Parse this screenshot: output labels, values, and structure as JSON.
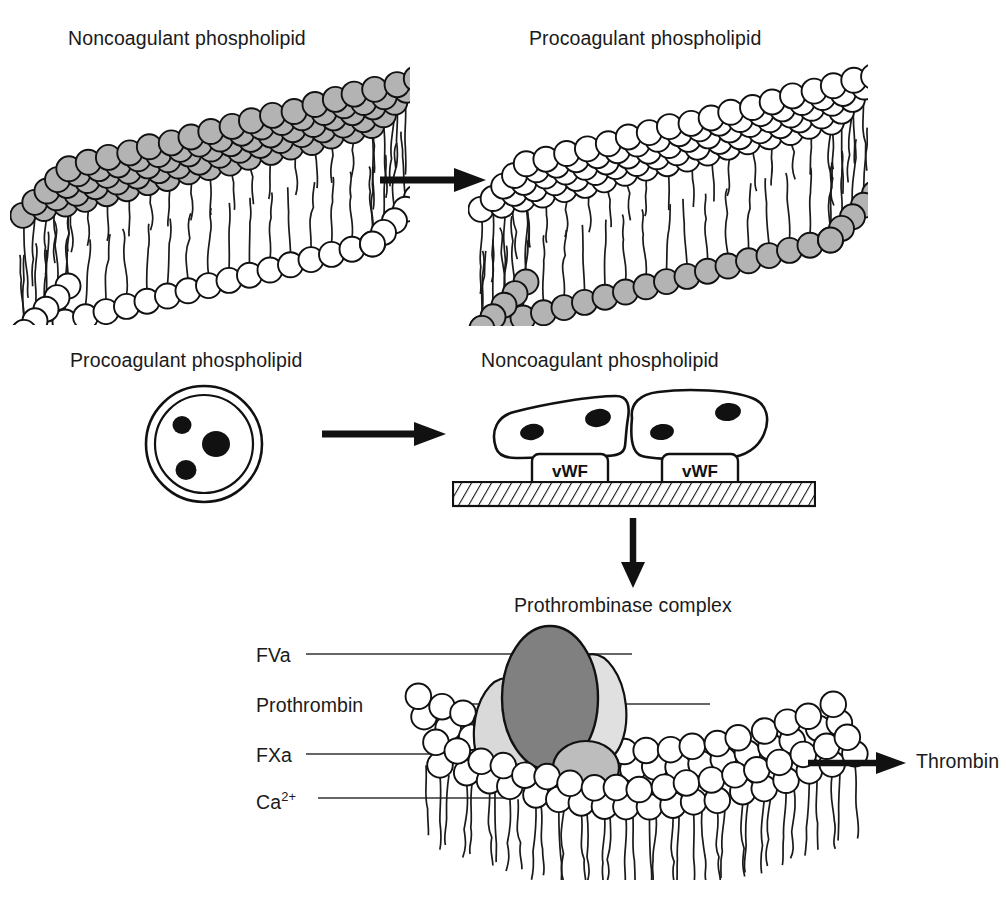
{
  "figure": {
    "kind": "biochemical-schematic"
  },
  "panel_top_left": {
    "title": "Noncoagulant phospholipid",
    "membrane": {
      "type": "bilayer",
      "outer_leaflet_head_color": "#b3b3b3",
      "inner_leaflet_head_color": "#ffffff",
      "description": "lipid bilayer block with shaded outer-leaflet headgroups and white inner-leaflet headgroups"
    }
  },
  "panel_top_right": {
    "title": "Procoagulant phospholipid",
    "membrane": {
      "type": "bilayer",
      "outer_leaflet_head_color": "#ffffff",
      "inner_leaflet_head_color": "#b3b3b3",
      "description": "lipid bilayer block with flipped asymmetry: white outer-leaflet headgroups and shaded inner-leaflet headgroups"
    }
  },
  "panel_mid_left": {
    "title": "Procoagulant phospholipid",
    "cell": {
      "shape": "resting-platelet-discoid",
      "rings": 2,
      "granule_count": 3,
      "granule_color": "#111111"
    }
  },
  "panel_mid_right": {
    "title": "Noncoagulant phospholipid",
    "cells": [
      {
        "shape": "spread-platelet",
        "granule_count": 2
      },
      {
        "shape": "spread-platelet",
        "granule_count": 2
      }
    ],
    "adhesion_boxes": [
      {
        "label": "vWF"
      },
      {
        "label": "vWF"
      }
    ],
    "surface": {
      "style": "hatched-subendothelium",
      "fill": "#ffffff",
      "hatch_color": "#111111"
    }
  },
  "panel_bottom": {
    "title": "Prothrombinase complex",
    "labels": [
      {
        "id": "fva",
        "text": "FVa"
      },
      {
        "id": "prothrombin",
        "text": "Prothrombin"
      },
      {
        "id": "fxa",
        "text": "FXa"
      },
      {
        "id": "ca2",
        "text": "Ca",
        "sup": "2+"
      }
    ],
    "components": [
      {
        "name": "FVa",
        "shape": "large-ellipse",
        "fill": "#808080"
      },
      {
        "name": "Prothrombin",
        "shape": "ellipse",
        "fill": "#e0e0e0"
      },
      {
        "name": "FXa",
        "shape": "ellipse",
        "fill": "#d9d9d9"
      },
      {
        "name": "Ca2+",
        "shape": "small-ellipse",
        "fill": "#bdbdbd"
      }
    ],
    "membrane": {
      "type": "monolayer-surface",
      "head_color": "#ffffff",
      "description": "procoagulant phospholipid surface of packed headgroups with acyl tails below"
    },
    "product": "Thrombin"
  },
  "arrows": [
    {
      "id": "arrow-top",
      "direction": "right",
      "from": "Noncoagulant phospholipid",
      "to": "Procoagulant phospholipid"
    },
    {
      "id": "arrow-mid",
      "direction": "right",
      "from": "Procoagulant phospholipid",
      "to": "Noncoagulant phospholipid"
    },
    {
      "id": "arrow-down",
      "direction": "down",
      "from": "adherent platelets",
      "to": "Prothrombinase complex"
    },
    {
      "id": "arrow-thrombin",
      "direction": "right",
      "from": "Prothrombinase complex",
      "to": "Thrombin"
    }
  ],
  "colors": {
    "ink": "#111111",
    "shaded_head": "#b3b3b3",
    "fva": "#808080",
    "prothrombin": "#e0e0e0",
    "fxa": "#d9d9d9",
    "calcium": "#bdbdbd"
  }
}
